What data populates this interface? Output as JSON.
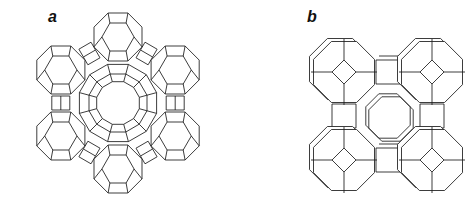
{
  "figure": {
    "panels": [
      {
        "id": "a",
        "label": "a",
        "label_pos": [
          48,
          9
        ],
        "structure": "faujasite-type framework: six sodalite cages linked by hexagonal prisms around a 12-ring supercage window",
        "center": [
          118,
          103
        ],
        "ring_radius": 66,
        "cage_radius": 26,
        "cage_count": 6,
        "start_angle_deg": -90,
        "inner_ring_radii": [
          40,
          30,
          22
        ],
        "inner_ring_sides": 12
      },
      {
        "id": "b",
        "label": "b",
        "label_pos": [
          307,
          9
        ],
        "structure": "LTA-type framework: four sodalite cages linked by cubic double 4-rings around an 8-ring window",
        "center": [
          388,
          116
        ],
        "cage_offset": 44,
        "cage_radius": 33,
        "window_radius": 24
      }
    ],
    "colors": {
      "line": "#1a1a1a",
      "background": "#ffffff"
    }
  }
}
